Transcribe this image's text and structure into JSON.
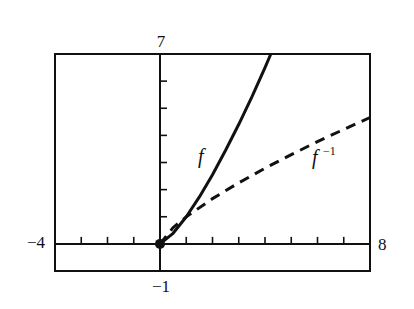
{
  "chart_data": {
    "type": "line",
    "title": "",
    "xlabel": "",
    "ylabel": "",
    "xlim": [
      -4,
      8
    ],
    "ylim": [
      -1,
      7
    ],
    "xscale_ticks_step": 1,
    "yscale_ticks_step": 1,
    "grid": false,
    "window_labels": {
      "xmin": "−4",
      "xmax": "8",
      "ymin": "−1",
      "ymax": "7"
    },
    "series": [
      {
        "name": "f",
        "label": "f",
        "style": "solid",
        "color": "#111111",
        "x": [
          0,
          0.5,
          1,
          1.5,
          2,
          2.5,
          3,
          3.5,
          4,
          4.22
        ],
        "y": [
          0,
          0.39,
          1,
          1.73,
          2.55,
          3.45,
          4.41,
          5.42,
          6.5,
          7
        ]
      },
      {
        "name": "f_inverse",
        "label": "f",
        "label_sup": "−1",
        "style": "dashed",
        "color": "#111111",
        "x": [
          0,
          0.5,
          1,
          2,
          3,
          4,
          5,
          6,
          7,
          8
        ],
        "y": [
          0,
          0.6,
          1,
          1.67,
          2.25,
          2.79,
          3.29,
          3.77,
          4.22,
          4.66
        ]
      }
    ],
    "points": [
      {
        "x": 0,
        "y": 0,
        "label": ""
      }
    ]
  }
}
